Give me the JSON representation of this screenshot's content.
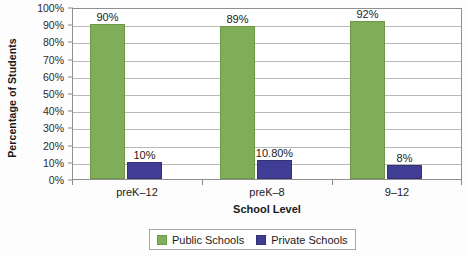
{
  "chart_data": {
    "type": "bar",
    "title": "",
    "xlabel": "School Level",
    "ylabel": "Percentage of Students",
    "categories": [
      "preK–12",
      "preK–8",
      "9–12"
    ],
    "series": [
      {
        "name": "Public Schools",
        "color": "#80ad57",
        "values": [
          90,
          89,
          92
        ],
        "labels": [
          "90%",
          "89%",
          "92%"
        ]
      },
      {
        "name": "Private Schools",
        "color": "#403e94",
        "values": [
          10,
          10.8,
          8
        ],
        "labels": [
          "10%",
          "10.80%",
          "8%"
        ]
      }
    ],
    "ylim": [
      0,
      100
    ],
    "ytick_values": [
      0,
      10,
      20,
      30,
      40,
      50,
      60,
      70,
      80,
      90,
      100
    ],
    "ytick_labels": [
      "0%",
      "10%",
      "20%",
      "30%",
      "40%",
      "50%",
      "60%",
      "70%",
      "80%",
      "90%",
      "100%"
    ],
    "grid": true,
    "legend_position": "bottom-center",
    "legend": [
      "Public Schools",
      "Private Schools"
    ]
  },
  "axes": {
    "y_title": "Percentage of Students",
    "x_title": "School Level"
  },
  "legend": {
    "public_label": "Public Schools",
    "private_label": "Private Schools"
  }
}
